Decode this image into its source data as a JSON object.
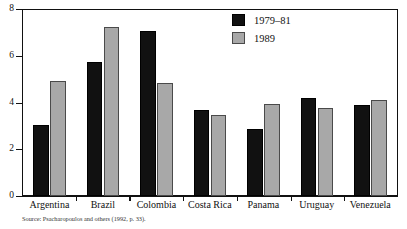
{
  "chart_data": {
    "type": "bar",
    "title": "",
    "xlabel": "",
    "ylabel": "",
    "ylim": [
      0,
      8
    ],
    "yticks": [
      0,
      2,
      4,
      6,
      8
    ],
    "ytick_labels": [
      "0",
      "2",
      "4",
      "6",
      "8"
    ],
    "grid": false,
    "legend_position": "top-right",
    "categories": [
      "Argentina",
      "Brazil",
      "Colombia",
      "Costa Rica",
      "Panama",
      "Uruguay",
      "Venezuela"
    ],
    "series": [
      {
        "name": "1979–81",
        "color": "#111111",
        "values": [
          3.05,
          5.75,
          7.05,
          3.7,
          2.85,
          4.2,
          3.9
        ]
      },
      {
        "name": "1989",
        "color": "#a8a8a8",
        "values": [
          4.9,
          7.25,
          4.85,
          3.45,
          3.95,
          3.75,
          4.1
        ]
      }
    ],
    "source_note": "Source: Psacharopoulos and others (1992, p. 33)."
  },
  "legend": {
    "items": [
      {
        "label": "1979–81",
        "swatch": "black"
      },
      {
        "label": "1989",
        "swatch": "gray"
      }
    ]
  },
  "axes": {
    "y_tick_labels": [
      "8",
      "6",
      "4",
      "2",
      "0"
    ]
  }
}
